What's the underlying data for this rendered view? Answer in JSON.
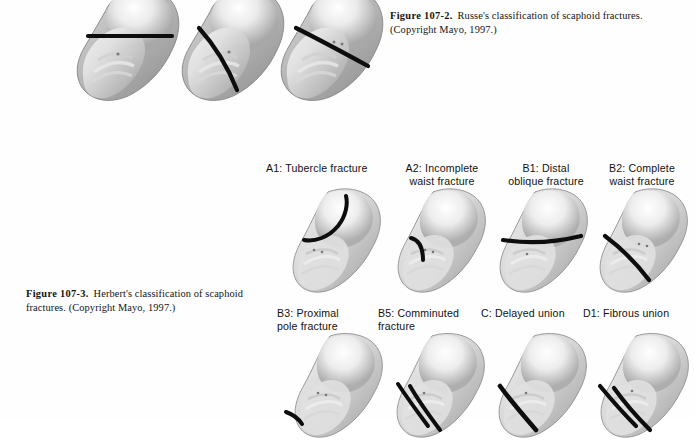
{
  "page": {
    "background": "#fefefe",
    "ink": "#111111",
    "fracture_line_color": "#0d0d0d"
  },
  "figures": [
    {
      "id": "figure-107-2",
      "lead": "Figure 107-2.",
      "text": "Russe's classification of scaphoid fractures.",
      "credit": "(Copyright Mayo, 1997.)",
      "specimen_count": 3
    },
    {
      "id": "figure-107-3",
      "lead": "Figure 107-3.",
      "text": "Herbert's classification of scaphoid fractures.",
      "credit": "(Copyright Mayo, 1997.)",
      "specimen_count": 8
    }
  ],
  "russe_specimens": [
    {
      "name": "transverse-fracture",
      "fracture": "horizontal"
    },
    {
      "name": "vertical-oblique-fracture",
      "fracture": "steep-oblique"
    },
    {
      "name": "horizontal-oblique-fracture",
      "fracture": "diagonal"
    }
  ],
  "herbert_labels_row1": [
    {
      "line1": "A1: Tubercle fracture",
      "line2": ""
    },
    {
      "line1": "A2: Incomplete",
      "line2": "waist fracture"
    },
    {
      "line1": "B1: Distal",
      "line2": "oblique fracture"
    },
    {
      "line1": "B2: Complete",
      "line2": "waist fracture"
    }
  ],
  "herbert_labels_row2": [
    {
      "line1": "B3: Proximal",
      "line2": "pole fracture"
    },
    {
      "line1": "B5: Comminuted",
      "line2": "fracture"
    },
    {
      "line1": "C: Delayed union",
      "line2": ""
    },
    {
      "line1": "D1: Fibrous union",
      "line2": ""
    }
  ],
  "herbert_specimens_row1": [
    {
      "name": "a1-tubercle",
      "fracture": "curved-proximal-arc"
    },
    {
      "name": "a2-incomplete-waist",
      "fracture": "short-hook"
    },
    {
      "name": "b1-distal-oblique",
      "fracture": "horizontal-across"
    },
    {
      "name": "b2-complete-waist",
      "fracture": "long-oblique"
    }
  ],
  "herbert_specimens_row2": [
    {
      "name": "b3-proximal-pole",
      "fracture": "proximal-line"
    },
    {
      "name": "b5-comminuted",
      "fracture": "double-line"
    },
    {
      "name": "c-delayed-union",
      "fracture": "single-thick-line"
    },
    {
      "name": "d1-fibrous-union",
      "fracture": "double-line-wide"
    }
  ]
}
